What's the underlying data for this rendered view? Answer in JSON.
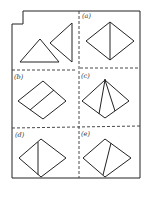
{
  "figure": {
    "panels": [
      {
        "id": "start",
        "label": "",
        "description": "two triangles"
      },
      {
        "id": "a",
        "label": "(a)"
      },
      {
        "id": "b",
        "label": "(b)"
      },
      {
        "id": "c",
        "label": "(c)"
      },
      {
        "id": "d",
        "label": "(d)"
      },
      {
        "id": "e",
        "label": "(e)"
      }
    ]
  }
}
